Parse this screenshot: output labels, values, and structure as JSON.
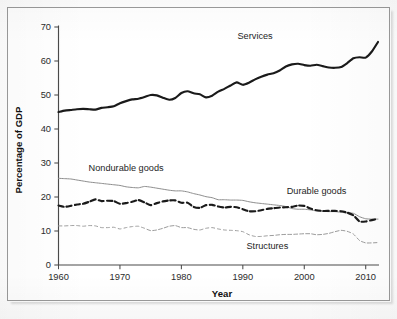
{
  "figure": {
    "background_color": "#ffffff",
    "frame_color": "#9a9a9a"
  },
  "chart_data": {
    "type": "line",
    "title": "",
    "xlabel": "Year",
    "ylabel": "Percentage of GDP",
    "xlim": [
      1960,
      2012
    ],
    "ylim": [
      0,
      70
    ],
    "xticks": [
      1960,
      1970,
      1980,
      1990,
      2000,
      2010
    ],
    "xticklabels": [
      "1960",
      "1970",
      "1980",
      "1990",
      "2000",
      "2010"
    ],
    "yticks": [
      0,
      10,
      20,
      30,
      40,
      50,
      60,
      70
    ],
    "yticklabels": [
      "0",
      "10",
      "20",
      "30",
      "40",
      "50",
      "60",
      "70"
    ],
    "grid": false,
    "legend": "inline-annotations",
    "annotations": [
      {
        "text": "Services",
        "x": 1992,
        "y": 66.5
      },
      {
        "text": "Nondurable goods",
        "x": 1971,
        "y": 27.6
      },
      {
        "text": "Durable goods",
        "x": 2002,
        "y": 21.0
      },
      {
        "text": "Structures",
        "x": 1994,
        "y": 4.6
      }
    ],
    "x": [
      1960,
      1961,
      1962,
      1963,
      1964,
      1965,
      1966,
      1967,
      1968,
      1969,
      1970,
      1971,
      1972,
      1973,
      1974,
      1975,
      1976,
      1977,
      1978,
      1979,
      1980,
      1981,
      1982,
      1983,
      1984,
      1985,
      1986,
      1987,
      1988,
      1989,
      1990,
      1991,
      1992,
      1993,
      1994,
      1995,
      1996,
      1997,
      1998,
      1999,
      2000,
      2001,
      2002,
      2003,
      2004,
      2005,
      2006,
      2007,
      2008,
      2009,
      2010,
      2011,
      2012
    ],
    "series": [
      {
        "name": "Services",
        "style": "solid",
        "line_weight": "thick",
        "color": "#1a1a1a",
        "values": [
          45.0,
          45.4,
          45.6,
          45.8,
          45.9,
          45.8,
          45.7,
          46.2,
          46.4,
          46.7,
          47.6,
          48.2,
          48.7,
          48.9,
          49.4,
          50.0,
          49.9,
          49.2,
          48.6,
          49.1,
          50.6,
          51.1,
          50.5,
          50.2,
          49.3,
          49.8,
          51.0,
          51.8,
          52.8,
          53.7,
          53.0,
          53.6,
          54.6,
          55.4,
          56.0,
          56.4,
          57.2,
          58.4,
          59.0,
          59.2,
          58.8,
          58.6,
          58.9,
          58.5,
          58.1,
          58.0,
          58.2,
          59.4,
          60.8,
          61.1,
          61.0,
          62.8,
          65.6
        ]
      },
      {
        "name": "Nondurable goods",
        "style": "solid",
        "line_weight": "thin",
        "color": "#8d8d8d",
        "values": [
          25.5,
          25.4,
          25.3,
          25.0,
          24.7,
          24.4,
          24.2,
          24.0,
          23.8,
          23.6,
          23.4,
          23.0,
          22.8,
          22.7,
          23.1,
          22.9,
          22.6,
          22.3,
          22.0,
          21.8,
          21.8,
          21.5,
          21.0,
          20.6,
          20.1,
          19.8,
          19.2,
          19.2,
          19.1,
          19.1,
          19.0,
          18.6,
          18.3,
          18.1,
          17.9,
          17.7,
          17.5,
          17.2,
          16.6,
          16.4,
          16.4,
          16.2,
          15.9,
          15.8,
          15.7,
          15.7,
          15.5,
          15.3,
          15.2,
          14.2,
          13.6,
          13.5,
          13.5
        ]
      },
      {
        "name": "Durable goods",
        "style": "dashed",
        "line_weight": "thick",
        "color": "#1a1a1a",
        "values": [
          17.5,
          17.1,
          17.4,
          17.8,
          18.0,
          18.6,
          19.3,
          18.8,
          18.9,
          18.8,
          18.0,
          18.2,
          18.6,
          19.1,
          18.4,
          17.6,
          18.2,
          18.7,
          19.0,
          19.0,
          18.3,
          18.3,
          17.1,
          16.8,
          17.6,
          17.7,
          17.2,
          16.9,
          17.1,
          17.0,
          16.4,
          15.8,
          15.8,
          16.1,
          16.5,
          16.7,
          16.9,
          17.0,
          17.1,
          17.5,
          17.4,
          16.6,
          16.1,
          15.9,
          15.9,
          15.9,
          15.8,
          15.4,
          14.6,
          12.8,
          12.8,
          13.2,
          13.6
        ]
      },
      {
        "name": "Structures",
        "style": "dashed",
        "line_weight": "thin",
        "color": "#9c9c9c",
        "values": [
          11.5,
          11.5,
          11.6,
          11.6,
          11.4,
          11.6,
          11.5,
          11.0,
          11.0,
          11.1,
          10.6,
          11.0,
          11.3,
          11.4,
          10.8,
          10.1,
          10.3,
          10.8,
          11.4,
          11.6,
          11.0,
          11.0,
          10.5,
          10.3,
          10.8,
          11.0,
          10.6,
          10.3,
          10.2,
          10.1,
          9.8,
          8.9,
          8.4,
          8.4,
          8.6,
          8.7,
          8.9,
          9.0,
          9.0,
          9.1,
          9.2,
          9.2,
          8.9,
          9.0,
          9.3,
          9.8,
          10.2,
          9.9,
          9.1,
          7.2,
          6.5,
          6.5,
          6.6
        ]
      }
    ]
  }
}
